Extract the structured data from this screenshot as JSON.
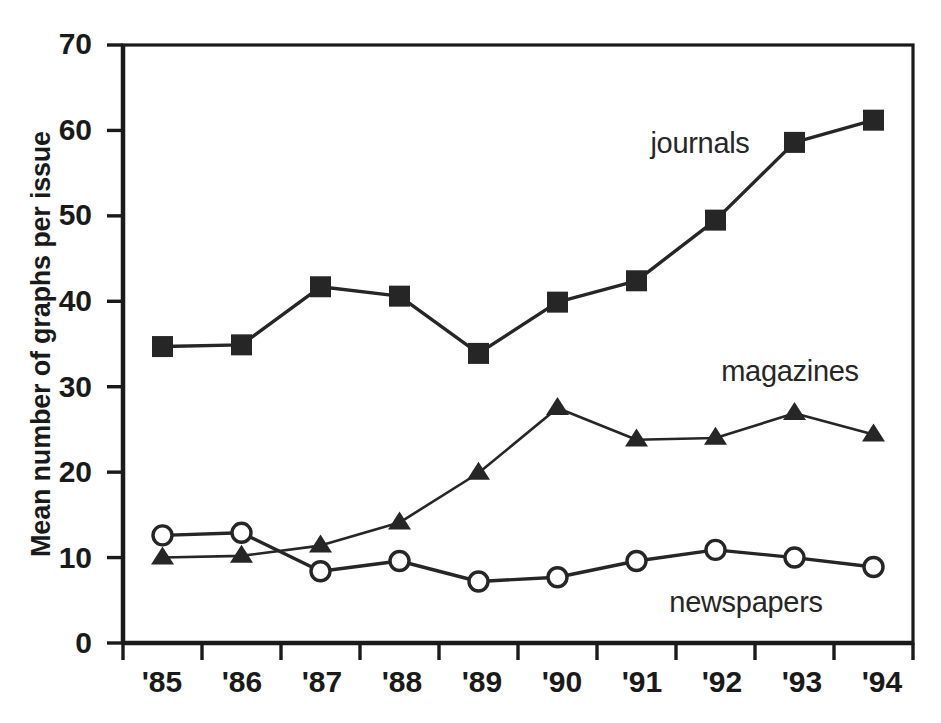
{
  "chart_data": {
    "type": "line",
    "title": "",
    "xlabel": "",
    "ylabel": "Mean number of graphs per issue",
    "categories": [
      "'85",
      "'86",
      "'87",
      "'88",
      "'89",
      "'90",
      "'91",
      "'92",
      "'93",
      "'94"
    ],
    "x_tick_labels": [
      "'85",
      "'86",
      "'87",
      "'88",
      "'89",
      "'90",
      "'91",
      "'92",
      "'93",
      "'94"
    ],
    "y_tick_labels": [
      "0",
      "10",
      "20",
      "30",
      "40",
      "50",
      "60",
      "70"
    ],
    "y_ticks": [
      0,
      10,
      20,
      30,
      40,
      50,
      60,
      70
    ],
    "ylim": [
      0,
      70
    ],
    "grid": false,
    "legend_position": "inline-annotations",
    "series": [
      {
        "name": "journals",
        "marker": "filled-square",
        "color": "#262626",
        "values": [
          34.7,
          34.9,
          41.7,
          40.6,
          33.9,
          39.9,
          42.4,
          49.5,
          58.6,
          61.2
        ]
      },
      {
        "name": "magazines",
        "marker": "filled-triangle",
        "color": "#262626",
        "values": [
          10.0,
          10.2,
          11.4,
          14.1,
          19.9,
          27.5,
          23.8,
          24.0,
          26.9,
          24.4
        ]
      },
      {
        "name": "newspapers",
        "marker": "open-circle",
        "color": "#262626",
        "values": [
          12.6,
          12.9,
          8.4,
          9.6,
          7.2,
          7.7,
          9.6,
          10.9,
          10.0,
          8.9
        ]
      }
    ],
    "annotations": [
      {
        "text": "journals",
        "x": 700,
        "y": 143
      },
      {
        "text": "magazines",
        "x": 790,
        "y": 371
      },
      {
        "text": "newspapers",
        "x": 746,
        "y": 602
      }
    ]
  },
  "axis": {
    "y_title": "Mean number of graphs per issue"
  }
}
